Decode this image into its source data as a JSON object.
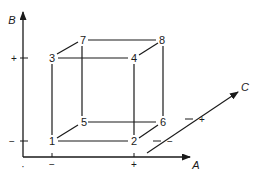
{
  "diagram": {
    "type": "cube-factorial-design",
    "colors": {
      "line": "#1a1a1a",
      "background": "#ffffff"
    },
    "axes": {
      "A": {
        "label": "A",
        "low": "−",
        "high": "+"
      },
      "B": {
        "label": "B",
        "low": "−",
        "high": "+"
      },
      "C": {
        "label": "C",
        "low": "−",
        "high": "+"
      }
    },
    "vertices": [
      {
        "id": "1",
        "label": "1"
      },
      {
        "id": "2",
        "label": "2"
      },
      {
        "id": "3",
        "label": "3"
      },
      {
        "id": "4",
        "label": "4"
      },
      {
        "id": "5",
        "label": "5"
      },
      {
        "id": "6",
        "label": "6"
      },
      {
        "id": "7",
        "label": "7"
      },
      {
        "id": "8",
        "label": "8"
      }
    ],
    "origin_tick": "·"
  }
}
